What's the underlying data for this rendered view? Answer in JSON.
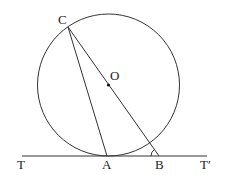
{
  "diagram": {
    "labels": {
      "C": "C",
      "O": "O",
      "T": "T",
      "A": "A",
      "B": "B",
      "T_prime": "T′"
    },
    "points": {
      "C": [
        68,
        27
      ],
      "O": [
        108,
        85
      ],
      "A": [
        107,
        156
      ],
      "B": [
        159,
        156
      ]
    },
    "circle": {
      "cx": 108.5,
      "cy": 85,
      "r": 71
    },
    "line_color": "#333333"
  }
}
